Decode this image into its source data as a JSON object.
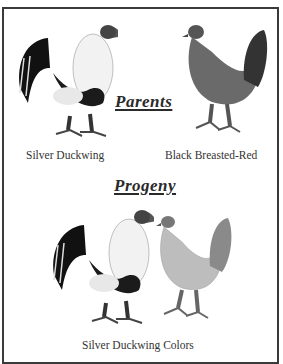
{
  "parents": {
    "heading": "Parents",
    "left_caption": "Silver Duckwing",
    "right_caption": "Black Breasted-Red"
  },
  "progeny": {
    "heading": "Progeny",
    "caption": "Silver Duckwing Colors"
  },
  "colors": {
    "border": "#3a3a3a",
    "text": "#333333"
  }
}
